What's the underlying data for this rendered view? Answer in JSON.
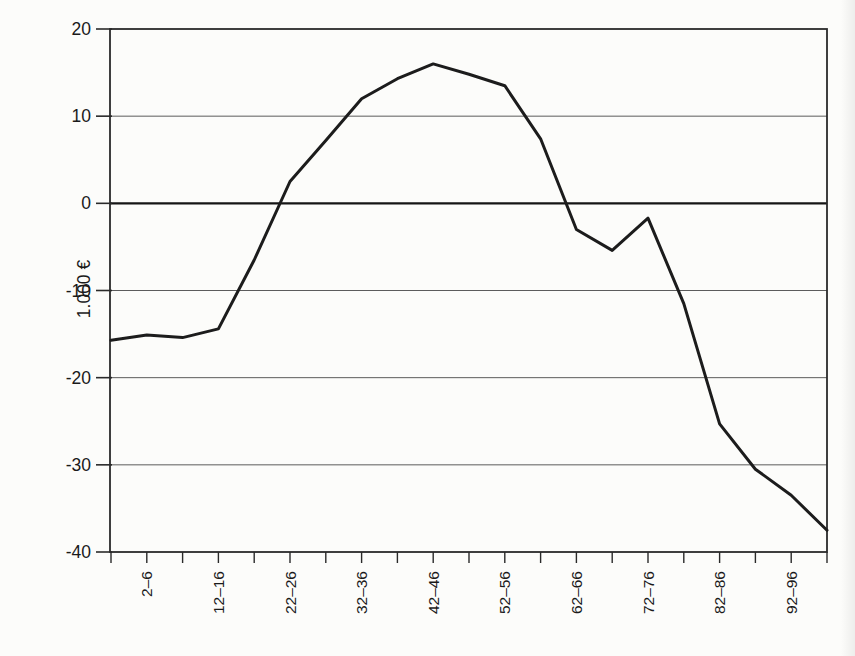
{
  "chart_data": {
    "type": "line",
    "title": "",
    "xlabel": "",
    "ylabel": "1.000 €",
    "ylim": [
      -40,
      20
    ],
    "yticks": [
      20,
      10,
      0,
      -10,
      -20,
      -30,
      -40
    ],
    "grid": true,
    "zero_line_emphasized": true,
    "legend": "none",
    "x_tick_count": 21,
    "x_tick_labels": [
      "",
      "2–6",
      "",
      "12–16",
      "",
      "22–26",
      "",
      "32–36",
      "",
      "42–46",
      "",
      "52–56",
      "",
      "62–66",
      "",
      "72–76",
      "",
      "82–86",
      "",
      "92–96",
      ""
    ],
    "series": [
      {
        "name": "values-in-1000-eur",
        "values": [
          -15.7,
          -15.1,
          -15.4,
          -14.4,
          -6.5,
          2.5,
          7.2,
          12.0,
          14.3,
          16.0,
          14.8,
          13.5,
          7.4,
          -3.0,
          -5.4,
          -1.7,
          -11.5,
          -25.3,
          -30.5,
          -33.5,
          -37.5
        ]
      }
    ],
    "line_color": "#1c1c1c",
    "axis_color": "#2a2a2a",
    "grid_color": "#4a4a4a",
    "paper_color": "#fcfcfa"
  }
}
